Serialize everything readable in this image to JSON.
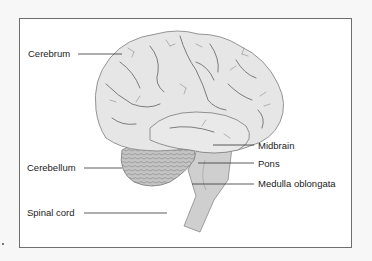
{
  "diagram": {
    "title": "",
    "labels": {
      "cerebrum": "Cerebrum",
      "cerebellum": "Cerebellum",
      "spinal_cord": "Spinal cord",
      "midbrain": "Midbrain",
      "pons": "Pons",
      "medulla": "Medulla oblongata"
    },
    "colors": {
      "frame_border": "#6e6e6e",
      "brain_fill": "#e4e4e4",
      "brain_stroke": "#8a8a8a",
      "sulci": "#6f6f6f",
      "cerebellum_fill": "#bdbdbd",
      "brainstem_fill": "#cfcfcf",
      "leader_line": "#333333"
    }
  }
}
